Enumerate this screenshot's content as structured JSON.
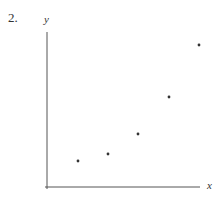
{
  "problem_number": "2.",
  "chart_data": {
    "type": "scatter",
    "title": "",
    "xlabel": "x",
    "ylabel": "y",
    "grid": false,
    "legend": null,
    "x_ticks": [],
    "y_ticks": [],
    "points_pixel": [
      [
        78,
        161
      ],
      [
        108,
        154
      ],
      [
        138,
        134
      ],
      [
        169,
        97
      ],
      [
        199,
        45
      ]
    ],
    "x": [
      1,
      2,
      3,
      4,
      5
    ],
    "y": [
      1.0,
      1.3,
      2.0,
      3.4,
      5.1
    ],
    "axis_origin_px": [
      47,
      187
    ],
    "x_axis_end_px": 200,
    "y_axis_top_px": 32
  }
}
